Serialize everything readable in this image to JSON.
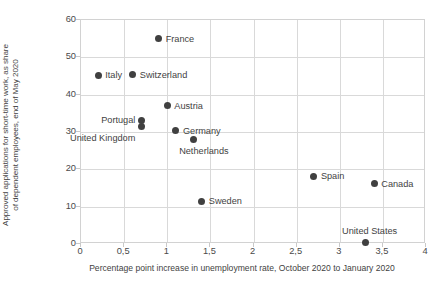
{
  "chart_data": {
    "type": "scatter",
    "title": "",
    "xlabel": "Percentage point increase in unemployment rate, October 2020 to January 2020",
    "ylabel": "Approved applications for short-time work, as share of dependent employees, end of May 2020",
    "ylabel_lines": [
      "Approved applications for short-time work, as share",
      "of dependent employees, end of May 2020"
    ],
    "xlim": [
      0,
      4
    ],
    "ylim": [
      0,
      60
    ],
    "grid": true,
    "legend": "none",
    "marker_color": "#404040",
    "gridline_color": "#d9d9d9",
    "xticks": [
      "0",
      "0,5",
      "1",
      "1,5",
      "2",
      "2,5",
      "3",
      "3,5",
      "4"
    ],
    "xtick_values": [
      0,
      0.5,
      1,
      1.5,
      2,
      2.5,
      3,
      3.5,
      4
    ],
    "yticks": [
      "0",
      "10",
      "20",
      "30",
      "40",
      "50",
      "60"
    ],
    "ytick_values": [
      0,
      10,
      20,
      30,
      40,
      50,
      60
    ],
    "points": [
      {
        "label": "France",
        "x": 0.9,
        "y": 55.0,
        "label_pos": "right"
      },
      {
        "label": "Italy",
        "x": 0.2,
        "y": 45.2,
        "label_pos": "right"
      },
      {
        "label": "Switzerland",
        "x": 0.6,
        "y": 45.4,
        "label_pos": "right"
      },
      {
        "label": "Austria",
        "x": 1.0,
        "y": 37.0,
        "label_pos": "right"
      },
      {
        "label": "Portugal",
        "x": 0.7,
        "y": 33.0,
        "label_pos": "left-up"
      },
      {
        "label": "United Kingdom",
        "x": 0.7,
        "y": 31.5,
        "label_pos": "left-down"
      },
      {
        "label": "Germany",
        "x": 1.1,
        "y": 30.3,
        "label_pos": "right"
      },
      {
        "label": "Netherlands",
        "x": 1.3,
        "y": 28.1,
        "label_pos": "below"
      },
      {
        "label": "Spain",
        "x": 2.7,
        "y": 18.2,
        "label_pos": "right"
      },
      {
        "label": "Canada",
        "x": 3.4,
        "y": 16.2,
        "label_pos": "right"
      },
      {
        "label": "Sweden",
        "x": 1.4,
        "y": 11.5,
        "label_pos": "right"
      },
      {
        "label": "United States",
        "x": 3.3,
        "y": 0.5,
        "label_pos": "above"
      }
    ]
  }
}
